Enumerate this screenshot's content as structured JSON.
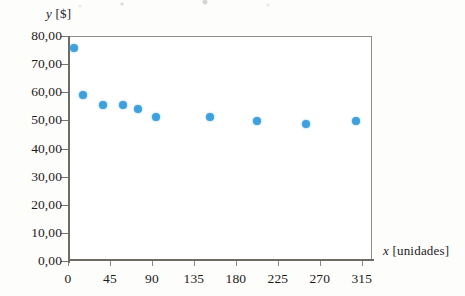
{
  "figure": {
    "background_color": "#fdfdfc",
    "frame_color": "#8f8c88",
    "marker_color": "#3fa0de"
  },
  "chart_data": {
    "type": "scatter",
    "title": "",
    "xlabel": "x [unidades]",
    "ylabel": "y [$]",
    "xlabel_var": "x",
    "xlabel_unit": "[unidades]",
    "ylabel_var": "y",
    "ylabel_unit": "[$]",
    "xlim": [
      0,
      326
    ],
    "ylim": [
      0,
      80
    ],
    "grid": false,
    "legend": null,
    "xticks": [
      0,
      45,
      90,
      135,
      180,
      225,
      270,
      315
    ],
    "xtick_labels": [
      "0",
      "45",
      "90",
      "135",
      "180",
      "225",
      "270",
      "315"
    ],
    "yticks": [
      0,
      10,
      20,
      30,
      40,
      50,
      60,
      70,
      80
    ],
    "ytick_labels": [
      "0,00",
      "10,00",
      "20,00",
      "30,00",
      "40,00",
      "50,00",
      "60,00",
      "70,00",
      "80,00"
    ],
    "decimal_separator": ",",
    "series": [
      {
        "name": "",
        "marker": "circle",
        "color": "#3fa0de",
        "points": [
          {
            "x": 5,
            "y": 76.0
          },
          {
            "x": 15,
            "y": 59.5
          },
          {
            "x": 36,
            "y": 56.0
          },
          {
            "x": 58,
            "y": 56.0
          },
          {
            "x": 74,
            "y": 54.5
          },
          {
            "x": 93,
            "y": 51.5
          },
          {
            "x": 151,
            "y": 51.5
          },
          {
            "x": 202,
            "y": 50.0
          },
          {
            "x": 254,
            "y": 49.0
          },
          {
            "x": 308,
            "y": 50.0
          }
        ]
      }
    ]
  }
}
